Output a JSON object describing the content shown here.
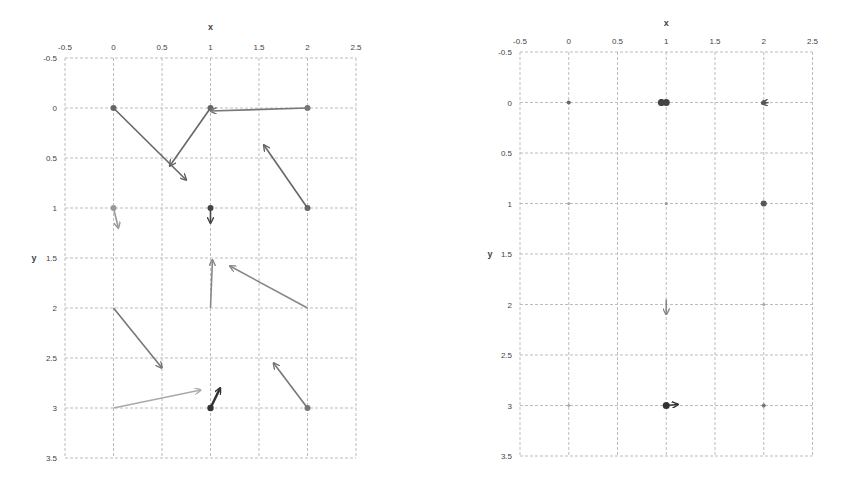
{
  "chart_data": [
    {
      "type": "scatter",
      "subtype": "vector-field",
      "title": "",
      "xlabel": "x",
      "ylabel": "y",
      "x_ticks": [
        "-0.5",
        "0",
        "0.5",
        "1",
        "1.5",
        "2",
        "2.5"
      ],
      "y_ticks": [
        "-0.5",
        "0",
        "0.5",
        "1",
        "1.5",
        "2",
        "2.5",
        "3",
        "3.5"
      ],
      "xlim": [
        -0.5,
        2.5
      ],
      "ylim": [
        -0.5,
        3.5
      ],
      "y_inverted": true,
      "x_axis_position": "top",
      "grid": true,
      "vectors": [
        {
          "x0": 0,
          "y0": 0,
          "x1": 0.75,
          "y1": 0.72,
          "color": "#666666",
          "dot": true
        },
        {
          "x0": 1,
          "y0": 0,
          "x1": 0.58,
          "y1": 0.58,
          "color": "#666666",
          "dot": true
        },
        {
          "x0": 2,
          "y0": 0,
          "x1": 1.0,
          "y1": 0.03,
          "color": "#777777",
          "dot": true
        },
        {
          "x0": 2,
          "y0": 1,
          "x1": 1.55,
          "y1": 0.37,
          "color": "#666666",
          "dot": true
        },
        {
          "x0": 0,
          "y0": 1,
          "x1": 0.05,
          "y1": 1.2,
          "color": "#999999",
          "dot": true
        },
        {
          "x0": 1,
          "y0": 1,
          "x1": 1.0,
          "y1": 1.15,
          "color": "#444444",
          "dot": true
        },
        {
          "x0": 1,
          "y0": 2,
          "x1": 1.02,
          "y1": 1.52,
          "color": "#888888",
          "dot": false
        },
        {
          "x0": 2,
          "y0": 2,
          "x1": 1.2,
          "y1": 1.58,
          "color": "#888888",
          "dot": false
        },
        {
          "x0": 0,
          "y0": 2,
          "x1": 0.5,
          "y1": 2.6,
          "color": "#777777",
          "dot": false
        },
        {
          "x0": 0,
          "y0": 3,
          "x1": 0.9,
          "y1": 2.82,
          "color": "#aaaaaa",
          "dot": false
        },
        {
          "x0": 1,
          "y0": 3,
          "x1": 1.1,
          "y1": 2.8,
          "color": "#333333",
          "dot": true,
          "thick": true
        },
        {
          "x0": 2,
          "y0": 3,
          "x1": 1.65,
          "y1": 2.55,
          "color": "#777777",
          "dot": true
        }
      ]
    },
    {
      "type": "scatter",
      "subtype": "vector-field",
      "title": "",
      "xlabel": "x",
      "ylabel": "y",
      "x_ticks": [
        "-0.5",
        "0",
        "0.5",
        "1",
        "1.5",
        "2",
        "2.5"
      ],
      "y_ticks": [
        "-0.5",
        "0",
        "0.5",
        "1",
        "1.5",
        "2",
        "2.5",
        "3",
        "3.5"
      ],
      "xlim": [
        -0.5,
        2.5
      ],
      "ylim": [
        -0.5,
        3.5
      ],
      "y_inverted": true,
      "x_axis_position": "top",
      "grid": true,
      "points": [
        {
          "x": 0,
          "y": 0,
          "size": 2,
          "color": "#666666"
        },
        {
          "x": 0.95,
          "y": 0,
          "size": 3.5,
          "color": "#444444"
        },
        {
          "x": 1,
          "y": 0,
          "size": 3.5,
          "color": "#444444"
        },
        {
          "x": 2,
          "y": 0,
          "size": 2.5,
          "color": "#666666"
        },
        {
          "x": 0,
          "y": 1,
          "size": 1.5,
          "color": "#aaaaaa"
        },
        {
          "x": 1,
          "y": 1,
          "size": 1.5,
          "color": "#999999"
        },
        {
          "x": 2,
          "y": 1,
          "size": 3,
          "color": "#555555"
        },
        {
          "x": 2,
          "y": 2,
          "size": 1.5,
          "color": "#aaaaaa"
        },
        {
          "x": 0,
          "y": 3,
          "size": 1.5,
          "color": "#aaaaaa"
        },
        {
          "x": 1,
          "y": 3,
          "size": 3.5,
          "color": "#333333"
        },
        {
          "x": 2,
          "y": 3,
          "size": 2,
          "color": "#777777"
        }
      ],
      "vectors": [
        {
          "x0": 0.93,
          "y0": 0,
          "x1": 1.0,
          "y1": 0,
          "color": "#444444"
        },
        {
          "x0": 2.05,
          "y0": 0.0,
          "x1": 1.98,
          "y1": 0.01,
          "color": "#555555"
        },
        {
          "x0": 1,
          "y0": 1.95,
          "x1": 1.0,
          "y1": 2.1,
          "color": "#888888"
        },
        {
          "x0": 1.0,
          "y0": 3,
          "x1": 1.12,
          "y1": 2.99,
          "color": "#333333"
        }
      ]
    }
  ],
  "charts": [
    {
      "xlabel": "x",
      "ylabel": "y"
    },
    {
      "xlabel": "x",
      "ylabel": "y"
    }
  ]
}
